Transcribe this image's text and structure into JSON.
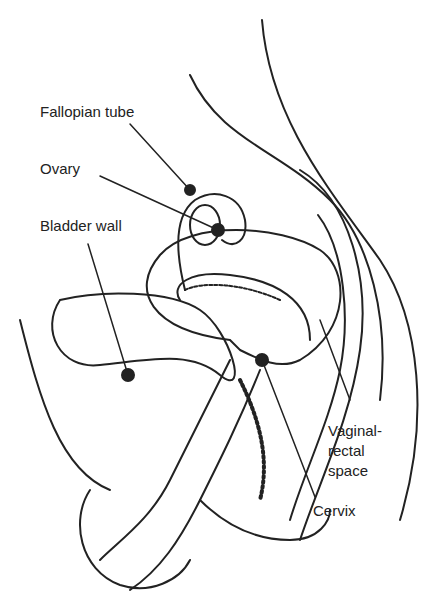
{
  "diagram": {
    "labels": {
      "fallopian_tube": "Fallopian tube",
      "ovary": "Ovary",
      "bladder_wall": "Bladder wall",
      "vaginal_rectal_1": "Vaginal-",
      "vaginal_rectal_2": "rectal",
      "vaginal_rectal_3": "space",
      "cervix": "Cervix"
    },
    "colors": {
      "ink": "#222222",
      "background": "#ffffff"
    }
  }
}
